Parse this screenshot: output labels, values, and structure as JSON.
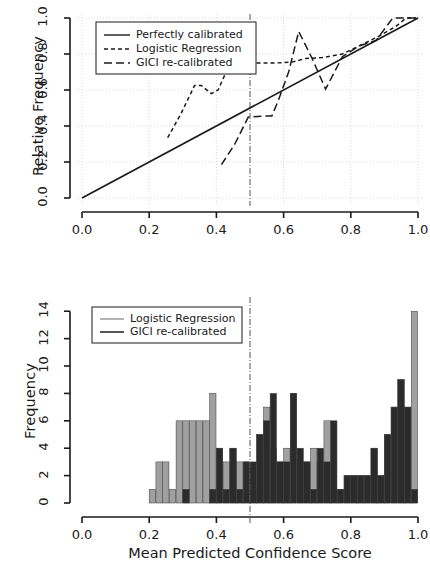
{
  "figure": {
    "kind": "two-panel calibration figure",
    "background": "#ffffff",
    "colors": {
      "axis": "#1a1a1a",
      "grid": "#c9c9c9",
      "gray_series": "#a0a0a0",
      "dark_series": "#2b2b2b",
      "threshold_line": "#555555"
    }
  },
  "top_panel": {
    "ylabel": "Relative Frequency",
    "xticks": [
      "0.0",
      "0.2",
      "0.4",
      "0.6",
      "0.8",
      "1.0"
    ],
    "yticks": [
      "0.0",
      "0.2",
      "0.4",
      "0.6",
      "0.8",
      "1.0"
    ],
    "legend": {
      "items": [
        {
          "label": "Perfectly calibrated",
          "style": "solid"
        },
        {
          "label": "Logistic Regression",
          "style": "dotted"
        },
        {
          "label": "GICI re-calibrated",
          "style": "dashed"
        }
      ]
    }
  },
  "bottom_panel": {
    "ylabel": "Frequency",
    "xlabel": "Mean Predicted Confidence Score",
    "xticks": [
      "0.0",
      "0.2",
      "0.4",
      "0.6",
      "0.8",
      "1.0"
    ],
    "yticks": [
      "0",
      "2",
      "4",
      "6",
      "8",
      "10",
      "12",
      "14"
    ],
    "legend": {
      "items": [
        {
          "label": "Logistic Regression",
          "style": "solid",
          "color": "#a0a0a0"
        },
        {
          "label": "GICI re-calibrated",
          "style": "solid",
          "color": "#2b2b2b"
        }
      ]
    }
  },
  "chart_data": [
    {
      "type": "line",
      "panel": "top",
      "title": "",
      "xlabel": "",
      "ylabel": "Relative Frequency",
      "xlim": [
        0.0,
        1.0
      ],
      "ylim": [
        0.0,
        1.0
      ],
      "grid": true,
      "legend_position": "top-left",
      "annotations": [
        {
          "type": "vline",
          "x": 0.5,
          "style": "dashdot",
          "color": "#555555"
        }
      ],
      "series": [
        {
          "name": "Perfectly calibrated",
          "style": "solid",
          "color": "#1a1a1a",
          "points": [
            [
              0.0,
              0.0
            ],
            [
              1.0,
              1.0
            ]
          ]
        },
        {
          "name": "Logistic Regression",
          "style": "dotted",
          "color": "#1a1a1a",
          "points": [
            [
              0.255,
              0.335
            ],
            [
              0.295,
              0.47
            ],
            [
              0.335,
              0.625
            ],
            [
              0.355,
              0.625
            ],
            [
              0.385,
              0.58
            ],
            [
              0.405,
              0.6
            ],
            [
              0.435,
              0.725
            ],
            [
              0.465,
              0.75
            ],
            [
              0.535,
              0.75
            ],
            [
              0.575,
              0.75
            ],
            [
              0.625,
              0.755
            ],
            [
              0.665,
              0.775
            ],
            [
              0.715,
              0.78
            ],
            [
              0.775,
              0.8
            ],
            [
              0.825,
              0.845
            ],
            [
              0.885,
              0.9
            ],
            [
              0.935,
              0.955
            ],
            [
              0.965,
              1.0
            ],
            [
              0.995,
              1.0
            ]
          ]
        },
        {
          "name": "GICI re-calibrated",
          "style": "dashed",
          "color": "#1a1a1a",
          "points": [
            [
              0.415,
              0.185
            ],
            [
              0.455,
              0.3
            ],
            [
              0.495,
              0.45
            ],
            [
              0.545,
              0.455
            ],
            [
              0.565,
              0.455
            ],
            [
              0.585,
              0.545
            ],
            [
              0.615,
              0.7
            ],
            [
              0.645,
              0.925
            ],
            [
              0.685,
              0.775
            ],
            [
              0.725,
              0.605
            ],
            [
              0.775,
              0.785
            ],
            [
              0.825,
              0.845
            ],
            [
              0.875,
              0.875
            ],
            [
              0.925,
              1.0
            ],
            [
              0.965,
              1.0
            ],
            [
              0.995,
              1.0
            ]
          ]
        }
      ]
    },
    {
      "type": "bar",
      "panel": "bottom",
      "title": "",
      "xlabel": "Mean Predicted Confidence Score",
      "ylabel": "Frequency",
      "xlim": [
        0.0,
        1.0
      ],
      "ylim": [
        0,
        14.6
      ],
      "grid": false,
      "bin_width": 0.02,
      "legend_position": "top-left",
      "annotations": [
        {
          "type": "vline",
          "x": 0.5,
          "style": "dashdot",
          "color": "#555555"
        }
      ],
      "series": [
        {
          "name": "Logistic Regression",
          "color": "#a0a0a0",
          "bins": [
            [
              0.2,
              1
            ],
            [
              0.22,
              3
            ],
            [
              0.24,
              3
            ],
            [
              0.26,
              1
            ],
            [
              0.28,
              6
            ],
            [
              0.3,
              6
            ],
            [
              0.32,
              6
            ],
            [
              0.34,
              6
            ],
            [
              0.36,
              6
            ],
            [
              0.38,
              8
            ],
            [
              0.4,
              4
            ],
            [
              0.42,
              3
            ],
            [
              0.44,
              4
            ],
            [
              0.46,
              3
            ],
            [
              0.48,
              3
            ],
            [
              0.5,
              1
            ],
            [
              0.52,
              5
            ],
            [
              0.54,
              7
            ],
            [
              0.56,
              4
            ],
            [
              0.58,
              3
            ],
            [
              0.6,
              4
            ],
            [
              0.62,
              8
            ],
            [
              0.64,
              3
            ],
            [
              0.66,
              3
            ],
            [
              0.68,
              4
            ],
            [
              0.7,
              3
            ],
            [
              0.72,
              6
            ],
            [
              0.74,
              1
            ],
            [
              0.76,
              1
            ],
            [
              0.78,
              2
            ],
            [
              0.8,
              2
            ],
            [
              0.82,
              2
            ],
            [
              0.84,
              2
            ],
            [
              0.86,
              4
            ],
            [
              0.88,
              2
            ],
            [
              0.9,
              5
            ],
            [
              0.92,
              7
            ],
            [
              0.94,
              9
            ],
            [
              0.96,
              7
            ],
            [
              0.98,
              14
            ]
          ]
        },
        {
          "name": "GICI re-calibrated",
          "color": "#2b2b2b",
          "bins": [
            [
              0.3,
              1
            ],
            [
              0.38,
              1
            ],
            [
              0.4,
              4
            ],
            [
              0.42,
              1
            ],
            [
              0.44,
              4
            ],
            [
              0.46,
              1
            ],
            [
              0.48,
              3
            ],
            [
              0.5,
              3
            ],
            [
              0.52,
              5
            ],
            [
              0.54,
              6
            ],
            [
              0.56,
              8
            ],
            [
              0.58,
              3
            ],
            [
              0.6,
              3
            ],
            [
              0.62,
              8
            ],
            [
              0.64,
              4
            ],
            [
              0.66,
              3
            ],
            [
              0.68,
              1
            ],
            [
              0.7,
              4
            ],
            [
              0.72,
              3
            ],
            [
              0.74,
              6
            ],
            [
              0.76,
              1
            ],
            [
              0.78,
              2
            ],
            [
              0.8,
              2
            ],
            [
              0.82,
              2
            ],
            [
              0.84,
              2
            ],
            [
              0.86,
              4
            ],
            [
              0.88,
              2
            ],
            [
              0.9,
              5
            ],
            [
              0.92,
              7
            ],
            [
              0.94,
              9
            ],
            [
              0.96,
              7
            ],
            [
              0.98,
              1
            ]
          ]
        }
      ]
    }
  ]
}
